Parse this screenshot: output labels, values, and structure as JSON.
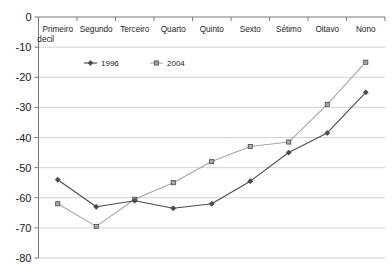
{
  "chart_data": {
    "type": "line",
    "title": "",
    "subtitle": "",
    "xlabel": "",
    "ylabel": "",
    "ylim": [
      -80,
      0
    ],
    "yticks": [
      0,
      -10,
      -20,
      -30,
      -40,
      -50,
      -60,
      -70,
      -80
    ],
    "ytick_labels": [
      "0",
      "-10",
      "-20",
      "-30",
      "-40",
      "-50",
      "-60",
      "-70",
      "-80"
    ],
    "grid": true,
    "grid_axis": "y",
    "legend_position": "top-left-inside",
    "categories": [
      "Primeiro decil",
      "Segundo",
      "Terceiro",
      "Quarto",
      "Quinto",
      "Sexto",
      "Sétimo",
      "Oitavo",
      "Nono"
    ],
    "category_lines": [
      [
        "Primeiro",
        "decil"
      ],
      [
        "Segundo"
      ],
      [
        "Terceiro"
      ],
      [
        "Quarto"
      ],
      [
        "Quinto"
      ],
      [
        "Sexto"
      ],
      [
        "Sétimo"
      ],
      [
        "Oitavo"
      ],
      [
        "Nono"
      ]
    ],
    "series": [
      {
        "name": "1996",
        "color": "#4a4a4a",
        "marker": "diamond",
        "values": [
          -54,
          -63,
          -61,
          -63.5,
          -62,
          -54.5,
          -45,
          -38.5,
          -25
        ]
      },
      {
        "name": "2004",
        "color": "#a6a6a6",
        "marker": "square",
        "values": [
          -62,
          -69.5,
          -60.5,
          -55,
          -48,
          -43,
          -41.5,
          -29,
          -15
        ]
      }
    ]
  },
  "legend": {
    "items": [
      {
        "label": "1996"
      },
      {
        "label": "2004"
      }
    ]
  },
  "colors": {
    "series_1996": "#4a4a4a",
    "series_2004": "#a6a6a6",
    "axis": "#7a7a7a",
    "grid": "#9a9a9a",
    "text": "#1a1a1a",
    "background": "#ffffff"
  }
}
